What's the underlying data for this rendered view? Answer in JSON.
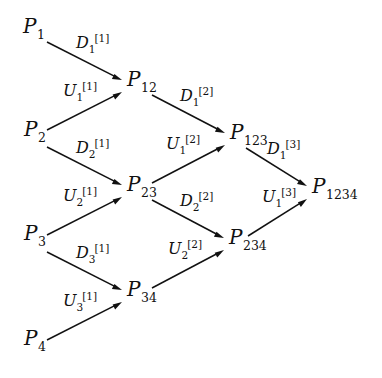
{
  "diagram": {
    "background_color": "#ffffff",
    "ink_color": "#111111",
    "width": 382,
    "height": 378,
    "nodes": [
      {
        "id": "P1",
        "var": "P",
        "sub": "1",
        "x": 23,
        "y": 33,
        "name": "node-p1"
      },
      {
        "id": "P2",
        "var": "P",
        "sub": "2",
        "x": 24,
        "y": 136,
        "name": "node-p2"
      },
      {
        "id": "P3",
        "var": "P",
        "sub": "3",
        "x": 24,
        "y": 240,
        "name": "node-p3"
      },
      {
        "id": "P4",
        "var": "P",
        "sub": "4",
        "x": 24,
        "y": 345,
        "name": "node-p4"
      },
      {
        "id": "P12",
        "var": "P",
        "sub": "12",
        "x": 127,
        "y": 86,
        "name": "node-p12"
      },
      {
        "id": "P23",
        "var": "P",
        "sub": "23",
        "x": 127,
        "y": 191,
        "name": "node-p23"
      },
      {
        "id": "P34",
        "var": "P",
        "sub": "34",
        "x": 127,
        "y": 296,
        "name": "node-p34"
      },
      {
        "id": "P123",
        "var": "P",
        "sub": "123",
        "x": 230,
        "y": 139,
        "name": "node-p123"
      },
      {
        "id": "P234",
        "var": "P",
        "sub": "234",
        "x": 229,
        "y": 244,
        "name": "node-p234"
      },
      {
        "id": "P1234",
        "var": "P",
        "sub": "1234",
        "x": 312,
        "y": 193,
        "name": "node-p1234"
      }
    ],
    "edges": [
      {
        "id": "e-p1-p12",
        "from": "P1",
        "to": "P12",
        "name": "edge-p1-to-p12",
        "x1": 47,
        "y1": 42,
        "x2": 122,
        "y2": 80,
        "label": {
          "var": "D",
          "sub": "1",
          "sup": "[1]",
          "x": 76,
          "y": 48
        }
      },
      {
        "id": "e-p2-p12",
        "from": "P2",
        "to": "P12",
        "name": "edge-p2-to-p12",
        "x1": 47,
        "y1": 130,
        "x2": 122,
        "y2": 92,
        "label": {
          "var": "U",
          "sub": "1",
          "sup": "[1]",
          "x": 63,
          "y": 96
        }
      },
      {
        "id": "e-p2-p23",
        "from": "P2",
        "to": "P23",
        "name": "edge-p2-to-p23",
        "x1": 47,
        "y1": 147,
        "x2": 122,
        "y2": 185,
        "label": {
          "var": "D",
          "sub": "2",
          "sup": "[1]",
          "x": 76,
          "y": 153
        }
      },
      {
        "id": "e-p3-p23",
        "from": "P3",
        "to": "P23",
        "name": "edge-p3-to-p23",
        "x1": 47,
        "y1": 235,
        "x2": 122,
        "y2": 197,
        "label": {
          "var": "U",
          "sub": "2",
          "sup": "[1]",
          "x": 63,
          "y": 201
        }
      },
      {
        "id": "e-p3-p34",
        "from": "P3",
        "to": "P34",
        "name": "edge-p3-to-p34",
        "x1": 47,
        "y1": 252,
        "x2": 122,
        "y2": 290,
        "label": {
          "var": "D",
          "sub": "3",
          "sup": "[1]",
          "x": 76,
          "y": 258
        }
      },
      {
        "id": "e-p4-p34",
        "from": "P4",
        "to": "P34",
        "name": "edge-p4-to-p34",
        "x1": 47,
        "y1": 340,
        "x2": 122,
        "y2": 302,
        "label": {
          "var": "U",
          "sub": "3",
          "sup": "[1]",
          "x": 63,
          "y": 306
        }
      },
      {
        "id": "e-p12-p123",
        "from": "P12",
        "to": "P123",
        "name": "edge-p12-to-p123",
        "x1": 152,
        "y1": 95,
        "x2": 225,
        "y2": 133,
        "label": {
          "var": "D",
          "sub": "1",
          "sup": "[2]",
          "x": 180,
          "y": 101
        }
      },
      {
        "id": "e-p23-p123",
        "from": "P23",
        "to": "P123",
        "name": "edge-p23-to-p123",
        "x1": 152,
        "y1": 183,
        "x2": 225,
        "y2": 145,
        "label": {
          "var": "U",
          "sub": "1",
          "sup": "[2]",
          "x": 166,
          "y": 149
        }
      },
      {
        "id": "e-p23-p234",
        "from": "P23",
        "to": "P234",
        "name": "edge-p23-to-p234",
        "x1": 152,
        "y1": 200,
        "x2": 224,
        "y2": 238,
        "label": {
          "var": "D",
          "sub": "2",
          "sup": "[2]",
          "x": 180,
          "y": 206
        }
      },
      {
        "id": "e-p34-p234",
        "from": "P34",
        "to": "P234",
        "name": "edge-p34-to-p234",
        "x1": 152,
        "y1": 288,
        "x2": 224,
        "y2": 250,
        "label": {
          "var": "U",
          "sub": "2",
          "sup": "[2]",
          "x": 168,
          "y": 254
        }
      },
      {
        "id": "e-p123-p1234",
        "from": "P123",
        "to": "P1234",
        "name": "edge-p123-to-p1234",
        "x1": 246,
        "y1": 148,
        "x2": 307,
        "y2": 186,
        "label": {
          "var": "D",
          "sub": "1",
          "sup": "[3]",
          "x": 267,
          "y": 154
        }
      },
      {
        "id": "e-p234-p1234",
        "from": "P234",
        "to": "P1234",
        "name": "edge-p234-to-p1234",
        "x1": 248,
        "y1": 236,
        "x2": 307,
        "y2": 199,
        "label": {
          "var": "U",
          "sub": "1",
          "sup": "[3]",
          "x": 262,
          "y": 202
        }
      }
    ]
  }
}
